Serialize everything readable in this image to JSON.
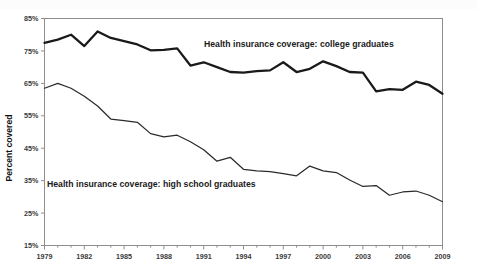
{
  "chart_data": {
    "type": "line",
    "title": "",
    "xlabel": "",
    "ylabel": "Percent covered",
    "xlim": [
      1979,
      2009
    ],
    "ylim": [
      15,
      85
    ],
    "grid": false,
    "legend_position": "inline-annotation",
    "y_tick_labels": [
      "85%",
      "75%",
      "65%",
      "55%",
      "45%",
      "35%",
      "25%",
      "15%"
    ],
    "y_ticks": [
      85,
      75,
      65,
      55,
      45,
      35,
      25,
      15
    ],
    "x_tick_labels": [
      "1979",
      "1982",
      "1985",
      "1988",
      "1991",
      "1994",
      "1997",
      "2000",
      "2003",
      "2006",
      "2009"
    ],
    "x_ticks": [
      1979,
      1982,
      1985,
      1988,
      1991,
      1994,
      1997,
      2000,
      2003,
      2006,
      2009
    ],
    "x_minor_ticks": [
      1980,
      1981,
      1983,
      1984,
      1986,
      1987,
      1989,
      1990,
      1992,
      1993,
      1995,
      1996,
      1998,
      1999,
      2001,
      2002,
      2004,
      2005,
      2007,
      2008
    ],
    "x": [
      1979,
      1980,
      1981,
      1982,
      1983,
      1984,
      1985,
      1986,
      1987,
      1988,
      1989,
      1990,
      1991,
      1992,
      1993,
      1994,
      1995,
      1996,
      1997,
      1998,
      1999,
      2000,
      2001,
      2002,
      2003,
      2004,
      2005,
      2006,
      2007,
      2008,
      2009
    ],
    "series": [
      {
        "name": "Health insurance coverage: college graduates",
        "color": "#1a1a1a",
        "line_width": 2.3,
        "annotation": "Health insurance coverage: college graduates",
        "values": [
          77.5,
          78.5,
          80.0,
          76.5,
          81.0,
          79.0,
          78.0,
          77.0,
          75.2,
          75.3,
          75.8,
          70.5,
          71.5,
          70.0,
          68.5,
          68.3,
          68.8,
          69.0,
          71.5,
          68.5,
          69.5,
          71.8,
          70.3,
          68.5,
          68.3,
          62.5,
          63.2,
          63.0,
          65.5,
          64.5,
          61.8
        ]
      },
      {
        "name": "Health insurance coverage: high school graduates",
        "color": "#2b2b2b",
        "line_width": 1.25,
        "annotation": "Health insurance coverage: high school graduates",
        "values": [
          63.5,
          65.0,
          63.5,
          61.0,
          58.0,
          54.0,
          53.5,
          53.0,
          49.5,
          48.5,
          49.0,
          47.0,
          44.5,
          41.0,
          42.2,
          38.5,
          38.0,
          37.8,
          37.2,
          36.5,
          39.5,
          38.0,
          37.5,
          35.2,
          33.2,
          33.5,
          30.5,
          31.5,
          31.8,
          30.5,
          28.5
        ]
      }
    ],
    "annotations": [
      {
        "text": "Health insurance coverage: college graduates",
        "x_px": 204,
        "y_px": 47
      },
      {
        "text": "Health insurance coverage: high school graduates",
        "x_px": 47,
        "y_px": 187
      }
    ]
  }
}
